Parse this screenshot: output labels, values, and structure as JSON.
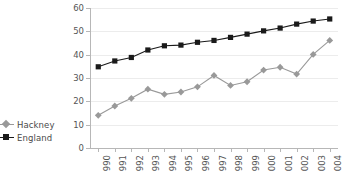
{
  "chart_data": {
    "type": "line",
    "title": "",
    "xlabel": "",
    "ylabel": "",
    "categories": [
      "1990",
      "1991",
      "1992",
      "1993",
      "1994",
      "1995",
      "1996",
      "1997",
      "1998",
      "1999",
      "2000",
      "2001",
      "2002",
      "2003",
      "2004"
    ],
    "x": [
      1990,
      1991,
      1992,
      1993,
      1994,
      1995,
      1996,
      1997,
      1998,
      1999,
      2000,
      2001,
      2002,
      2003,
      2004
    ],
    "ylim": [
      0,
      60
    ],
    "yticks": [
      0,
      10,
      20,
      30,
      40,
      50,
      60
    ],
    "grid": true,
    "legend_position": "left",
    "series": [
      {
        "name": "Hackney",
        "color": "#999999",
        "marker": "diamond",
        "values": [
          14.0,
          18.0,
          21.3,
          25.2,
          23.0,
          24.0,
          26.2,
          31.1,
          26.8,
          28.4,
          33.4,
          34.6,
          31.7,
          40.1,
          46.1
        ]
      },
      {
        "name": "England",
        "color": "#1a1a1a",
        "marker": "square",
        "values": [
          34.8,
          37.3,
          38.8,
          42.0,
          43.8,
          44.1,
          45.3,
          46.1,
          47.4,
          48.8,
          50.2,
          51.4,
          53.1,
          54.4,
          55.3
        ]
      }
    ]
  },
  "legend": {
    "items": [
      {
        "label": "Hackney",
        "color": "#999999",
        "marker": "diamond"
      },
      {
        "label": "England",
        "color": "#1a1a1a",
        "marker": "square"
      }
    ]
  },
  "axes": {
    "y_tick_labels": [
      "60",
      "50",
      "40",
      "30",
      "20",
      "10",
      "0"
    ],
    "x_tick_labels": [
      "1990",
      "1991",
      "1992",
      "1993",
      "1994",
      "1995",
      "1996",
      "1997",
      "1998",
      "1999",
      "2000",
      "2001",
      "2002",
      "2003",
      "2004"
    ]
  },
  "colors": {
    "hackney": "#999999",
    "england": "#1a1a1a",
    "grid": "#ececec",
    "axis": "#b7b7b7",
    "tick_text": "#555555",
    "legend_text": "#4a4a4a",
    "background": "#ffffff"
  }
}
